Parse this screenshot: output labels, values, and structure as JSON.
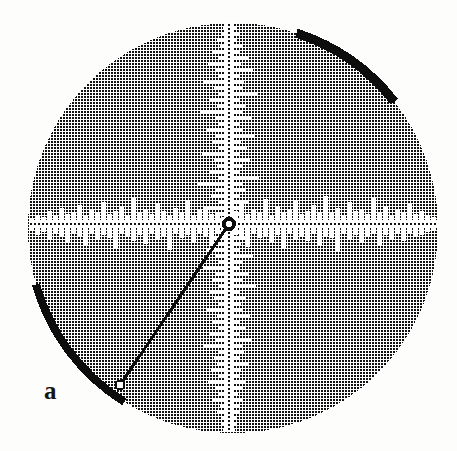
{
  "figure": {
    "kind": "halftone-circular-plot",
    "panel_label": "a",
    "panel_label_position": {
      "x": 44,
      "y": 381
    },
    "canvas": {
      "width": 457,
      "height": 451
    },
    "background_color": "#fdfdfc",
    "ink_color": "#111111",
    "axis_color": "#ffffff",
    "disk": {
      "center_x": 233,
      "center_y": 228,
      "radius": 205,
      "fill_description": "fine cross-hatch halftone dither, ~3px period, ~55% ink coverage",
      "dither_period_px": 3,
      "dither_dot_px": 2
    },
    "rim_arcs": [
      {
        "name": "upper-right-dark-arc",
        "start_angle_deg": 38,
        "end_angle_deg": 72,
        "thickness_px": 9,
        "color": "#0d0d0d"
      },
      {
        "name": "lower-left-dark-arc",
        "start_angle_deg": 196,
        "end_angle_deg": 238,
        "thickness_px": 8,
        "color": "#0d0d0d"
      }
    ],
    "origin_marker": {
      "name": "origin-ring",
      "x": 229,
      "y": 224,
      "outer_radius": 7,
      "inner_radius": 3.2,
      "color": "#0d0d0d"
    },
    "radial_line": {
      "name": "radial-pointer",
      "from_x": 229,
      "from_y": 224,
      "to_x": 120,
      "to_y": 385,
      "width_px": 3,
      "color": "#0d0d0d",
      "end_marker": {
        "radius": 4.5,
        "fill": "#fdfdfc",
        "stroke": "#0d0d0d"
      }
    },
    "axes": {
      "horizontal": {
        "name": "horizontal-axis-trace",
        "y": 224,
        "band_half_height": 4,
        "x_start": 30,
        "x_end": 437,
        "center_dash": "2 2"
      },
      "vertical": {
        "name": "vertical-axis-trace",
        "x": 229,
        "band_half_width": 4,
        "y_start": 24,
        "y_end": 432,
        "center_dash": "2 2"
      }
    }
  },
  "chart_data": {
    "type": "line",
    "title": "",
    "subtitle": "",
    "xlabel": "",
    "ylabel": "",
    "grid": false,
    "legend": null,
    "annotations": [
      "a"
    ],
    "series": [
      {
        "name": "horizontal-trace-upper-spikes",
        "axis": "horizontal",
        "x": [
          32,
          38,
          44,
          50,
          56,
          62,
          68,
          74,
          80,
          86,
          92,
          98,
          104,
          110,
          116,
          122,
          128,
          134,
          140,
          146,
          152,
          158,
          164,
          170,
          176,
          182,
          188,
          194,
          200,
          206,
          212,
          218,
          224,
          230,
          236,
          242,
          248,
          254,
          260,
          266,
          272,
          278,
          284,
          290,
          296,
          302,
          308,
          314,
          320,
          326,
          332,
          338,
          344,
          350,
          356,
          362,
          368,
          374,
          380,
          386,
          392,
          398,
          404,
          410,
          416,
          422,
          428,
          434
        ],
        "values": [
          2,
          5,
          3,
          9,
          4,
          12,
          6,
          8,
          15,
          5,
          10,
          7,
          18,
          6,
          9,
          13,
          5,
          22,
          8,
          11,
          6,
          16,
          9,
          4,
          12,
          7,
          20,
          5,
          10,
          14,
          6,
          8,
          3,
          5,
          9,
          17,
          6,
          11,
          8,
          21,
          5,
          13,
          7,
          10,
          19,
          6,
          9,
          15,
          8,
          24,
          7,
          12,
          5,
          18,
          9,
          11,
          6,
          23,
          8,
          14,
          5,
          10,
          7,
          16,
          6,
          9,
          4,
          3
        ]
      },
      {
        "name": "horizontal-trace-lower-spikes",
        "axis": "horizontal",
        "x": [
          32,
          38,
          44,
          50,
          56,
          62,
          68,
          74,
          80,
          86,
          92,
          98,
          104,
          110,
          116,
          122,
          128,
          134,
          140,
          146,
          152,
          158,
          164,
          170,
          176,
          182,
          188,
          194,
          200,
          206,
          212,
          218,
          224,
          230,
          236,
          242,
          248,
          254,
          260,
          266,
          272,
          278,
          284,
          290,
          296,
          302,
          308,
          314,
          320,
          326,
          332,
          338,
          344,
          350,
          356,
          362,
          368,
          374,
          380,
          386,
          392,
          398,
          404,
          410,
          416,
          422,
          428,
          434
        ],
        "values": [
          3,
          7,
          4,
          11,
          6,
          9,
          14,
          5,
          8,
          17,
          6,
          12,
          7,
          10,
          20,
          5,
          9,
          13,
          7,
          16,
          6,
          11,
          8,
          22,
          5,
          10,
          7,
          14,
          6,
          9,
          18,
          5,
          8,
          4,
          7,
          12,
          19,
          6,
          10,
          8,
          15,
          7,
          21,
          5,
          11,
          9,
          13,
          6,
          17,
          8,
          10,
          23,
          6,
          12,
          7,
          15,
          9,
          5,
          18,
          7,
          11,
          6,
          13,
          5,
          9,
          7,
          4,
          2
        ]
      },
      {
        "name": "vertical-trace-left-spikes",
        "axis": "vertical",
        "y": [
          28,
          34,
          40,
          46,
          52,
          58,
          64,
          70,
          76,
          82,
          88,
          94,
          100,
          106,
          112,
          118,
          124,
          130,
          136,
          142,
          148,
          154,
          160,
          166,
          172,
          178,
          184,
          190,
          196,
          202,
          208,
          214,
          220,
          226,
          232,
          238,
          244,
          250,
          256,
          262,
          268,
          274,
          280,
          286,
          292,
          298,
          304,
          310,
          316,
          322,
          328,
          334,
          340,
          346,
          352,
          358,
          364,
          370,
          376,
          382,
          388,
          394,
          400,
          406,
          412,
          418,
          424,
          430
        ],
        "values": [
          2,
          4,
          8,
          5,
          12,
          6,
          17,
          9,
          7,
          21,
          11,
          6,
          15,
          8,
          25,
          10,
          6,
          19,
          9,
          13,
          7,
          23,
          11,
          8,
          16,
          6,
          27,
          10,
          14,
          7,
          20,
          9,
          6,
          5,
          8,
          12,
          7,
          18,
          10,
          6,
          22,
          9,
          13,
          7,
          16,
          11,
          6,
          19,
          8,
          12,
          7,
          15,
          9,
          21,
          6,
          11,
          8,
          14,
          6,
          17,
          9,
          7,
          12,
          5,
          8,
          4,
          3,
          2
        ]
      },
      {
        "name": "vertical-trace-right-spikes",
        "axis": "vertical",
        "y": [
          28,
          34,
          40,
          46,
          52,
          58,
          64,
          70,
          76,
          82,
          88,
          94,
          100,
          106,
          112,
          118,
          124,
          130,
          136,
          142,
          148,
          154,
          160,
          166,
          172,
          178,
          184,
          190,
          196,
          202,
          208,
          214,
          220,
          226,
          232,
          238,
          244,
          250,
          256,
          262,
          268,
          274,
          280,
          286,
          292,
          298,
          304,
          310,
          316,
          322,
          328,
          334,
          340,
          346,
          352,
          358,
          364,
          370,
          376,
          382,
          388,
          394,
          400,
          406,
          412,
          418,
          424,
          430
        ],
        "values": [
          3,
          6,
          4,
          10,
          7,
          15,
          8,
          20,
          6,
          11,
          9,
          24,
          7,
          13,
          10,
          18,
          6,
          9,
          22,
          8,
          14,
          6,
          17,
          10,
          7,
          26,
          9,
          12,
          6,
          16,
          8,
          11,
          7,
          5,
          9,
          14,
          8,
          6,
          20,
          10,
          7,
          15,
          9,
          23,
          6,
          12,
          8,
          10,
          17,
          7,
          13,
          6,
          19,
          9,
          11,
          7,
          15,
          8,
          6,
          12,
          9,
          5,
          10,
          7,
          6,
          4,
          3,
          2
        ]
      }
    ]
  },
  "ghost_show_through": [
    {
      "text": "",
      "x": 60,
      "y": 10
    },
    {
      "text": "",
      "x": 70,
      "y": 32
    }
  ]
}
